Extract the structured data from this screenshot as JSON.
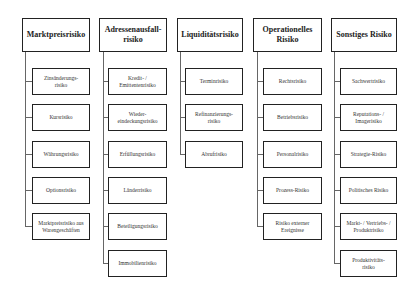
{
  "columns": [
    {
      "title": "Marktpreisrisiko",
      "items": [
        "Zinsänderungs-\nrisiko",
        "Kursrisiko",
        "Währungsrisiko",
        "Optionsrisiko",
        "Marktpreisrisiko aus Warengeschäften"
      ]
    },
    {
      "title": "Adressenausfall-\nrisiko",
      "items": [
        "Kredit- / Emittentenrisiko",
        "Wieder-\neindeckungsrisiko",
        "Erfüllungsrisiko",
        "Länderrisiko",
        "Beteiligungsrisiko",
        "Immobilienrisiko"
      ]
    },
    {
      "title": "Liquiditätsrisiko",
      "items": [
        "Terminrisiko",
        "Refinanzierungs-\nrisiko",
        "Abrufrisiko"
      ]
    },
    {
      "title": "Operationelles Risiko",
      "items": [
        "Rechtsrisiko",
        "Betriebsrisiko",
        "Personalrisiko",
        "Prozess-Risiko",
        "Risiko externer Ereignisse"
      ]
    },
    {
      "title": "Sonstiges Risiko",
      "items": [
        "Sachwertrisiko",
        "Reputations- / Imagerisiko",
        "Strategie-Risiko",
        "Politisches Risiko",
        "Markt- / Vertriebs- / Produktrisiko",
        "Produktivitäts-\nrisiko"
      ]
    }
  ]
}
